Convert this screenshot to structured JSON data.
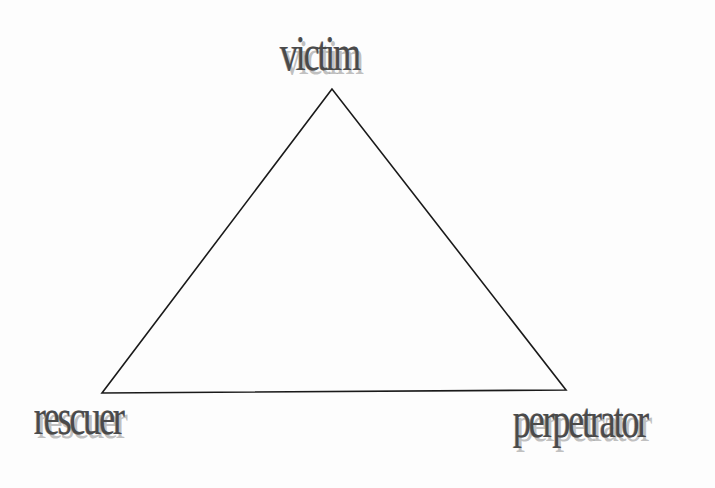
{
  "diagram": {
    "type": "triangle",
    "stroke_color": "#1a1a1a",
    "label_color": "#4a4a4a",
    "nodes": [
      {
        "id": "top",
        "label": "victim",
        "x": 332,
        "y": 89
      },
      {
        "id": "bottom_left",
        "label": "rescuer",
        "x": 102,
        "y": 393
      },
      {
        "id": "bottom_right",
        "label": "perpetrator",
        "x": 566,
        "y": 390
      }
    ],
    "edges": [
      {
        "from": "top",
        "to": "bottom_left"
      },
      {
        "from": "bottom_left",
        "to": "bottom_right"
      },
      {
        "from": "bottom_right",
        "to": "top"
      }
    ]
  }
}
